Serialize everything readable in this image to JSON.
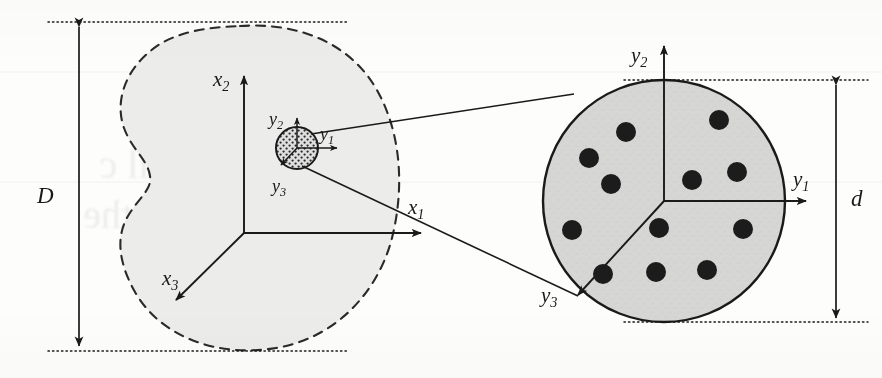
{
  "figure": {
    "type": "schematic-diagram",
    "background_color": "#fdfdfc",
    "ink_color": "#1a1a1a",
    "body_fill_color": "#ebebe9",
    "rve_fill_color": "#d4d4d4",
    "inclusion_color": "#1c1c1c"
  },
  "macro_body": {
    "name": "macroscopic-body",
    "outline_style": "dashed",
    "axes": [
      {
        "id": "x2",
        "base": "x",
        "sub": "2",
        "label": "x₂",
        "direction": "up"
      },
      {
        "id": "x1",
        "base": "x",
        "sub": "1",
        "label": "x₁",
        "direction": "right"
      },
      {
        "id": "x3",
        "base": "x",
        "sub": "3",
        "label": "x₃",
        "direction": "down-left"
      }
    ],
    "dimension": {
      "symbol": "D",
      "orientation": "vertical",
      "description": "macroscopic body characteristic length"
    }
  },
  "rve_small": {
    "name": "representative-volume-element-inset",
    "fill_pattern": "stippled-dots",
    "axes": [
      {
        "id": "y2",
        "base": "y",
        "sub": "2",
        "label": "y₂",
        "direction": "up"
      },
      {
        "id": "y1",
        "base": "y",
        "sub": "1",
        "label": "y₁",
        "direction": "right"
      },
      {
        "id": "y3",
        "base": "y",
        "sub": "3",
        "label": "y₃",
        "direction": "down-left"
      }
    ]
  },
  "rve_zoom": {
    "name": "representative-volume-element-magnified",
    "outline_style": "solid",
    "axes": [
      {
        "id": "y2",
        "base": "y",
        "sub": "2",
        "label": "y₂",
        "direction": "up"
      },
      {
        "id": "y1",
        "base": "y",
        "sub": "1",
        "label": "y₁",
        "direction": "right"
      },
      {
        "id": "y3",
        "base": "y",
        "sub": "3",
        "label": "y₃",
        "direction": "down-left"
      }
    ],
    "dimension": {
      "symbol": "d",
      "orientation": "vertical",
      "description": "representative volume element diameter"
    },
    "inclusion_count": 12,
    "inclusions": [
      {
        "cx": 626,
        "cy": 132,
        "r": 10
      },
      {
        "cx": 719,
        "cy": 120,
        "r": 10
      },
      {
        "cx": 589,
        "cy": 158,
        "r": 10
      },
      {
        "cx": 611,
        "cy": 184,
        "r": 10
      },
      {
        "cx": 692,
        "cy": 180,
        "r": 10
      },
      {
        "cx": 737,
        "cy": 172,
        "r": 10
      },
      {
        "cx": 572,
        "cy": 230,
        "r": 10
      },
      {
        "cx": 659,
        "cy": 228,
        "r": 10
      },
      {
        "cx": 743,
        "cy": 229,
        "r": 10
      },
      {
        "cx": 603,
        "cy": 274,
        "r": 10
      },
      {
        "cx": 656,
        "cy": 272,
        "r": 10
      },
      {
        "cx": 707,
        "cy": 270,
        "r": 10
      }
    ]
  },
  "labels": {
    "macro_dimension_D": "D",
    "rve_dimension_d": "d",
    "x1": "x",
    "x1_sub": "1",
    "x2": "x",
    "x2_sub": "2",
    "x3": "x",
    "x3_sub": "3",
    "y1_left": "y",
    "y1_left_sub": "1",
    "y2_left": "y",
    "y2_left_sub": "2",
    "y3_left": "y",
    "y3_left_sub": "3",
    "y1_right": "y",
    "y1_right_sub": "1",
    "y2_right": "y",
    "y2_right_sub": "2",
    "y3_right": "y",
    "y3_right_sub": "3"
  },
  "connectors": {
    "name": "magnification-callout-lines",
    "count": 2,
    "description": "lines linking the small RVE to its magnified view"
  }
}
